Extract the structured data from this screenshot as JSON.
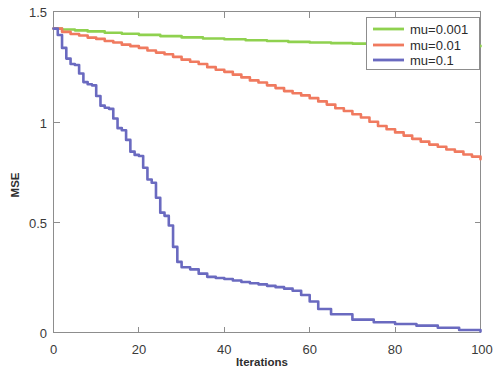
{
  "chart_data": {
    "type": "line",
    "title": "",
    "xlabel": "Iterations",
    "ylabel": "MSE",
    "xlim": [
      0,
      100
    ],
    "ylim": [
      0,
      1.5
    ],
    "xticks": [
      0,
      20,
      40,
      60,
      80,
      100
    ],
    "xtick_labels": [
      "0",
      "20",
      "40",
      "60",
      "80",
      "100"
    ],
    "yticks": [
      0,
      0.5,
      1,
      1.5
    ],
    "ytick_labels": [
      "0",
      "0.5",
      "1",
      "1.5"
    ],
    "grid": false,
    "legend_position": "top-right",
    "series": [
      {
        "name": "mu=0.001",
        "color": "#8FD14F",
        "x": [
          0,
          2,
          5,
          8,
          12,
          16,
          20,
          25,
          30,
          35,
          40,
          45,
          50,
          55,
          60,
          65,
          70,
          75,
          80,
          85,
          90,
          95,
          100
        ],
        "values": [
          1.42,
          1.416,
          1.412,
          1.407,
          1.401,
          1.396,
          1.391,
          1.385,
          1.379,
          1.374,
          1.37,
          1.366,
          1.362,
          1.358,
          1.355,
          1.352,
          1.35,
          1.347,
          1.345,
          1.343,
          1.341,
          1.34,
          1.338
        ]
      },
      {
        "name": "mu=0.01",
        "color": "#F07A5F",
        "x": [
          0,
          2,
          4,
          6,
          8,
          10,
          12,
          14,
          16,
          18,
          20,
          22,
          24,
          26,
          28,
          30,
          32,
          34,
          36,
          38,
          40,
          42,
          44,
          46,
          48,
          50,
          52,
          54,
          56,
          58,
          60,
          62,
          64,
          66,
          68,
          70,
          72,
          74,
          76,
          78,
          80,
          82,
          84,
          86,
          88,
          90,
          92,
          94,
          96,
          98,
          100
        ],
        "values": [
          1.42,
          1.405,
          1.395,
          1.388,
          1.378,
          1.372,
          1.362,
          1.355,
          1.345,
          1.338,
          1.33,
          1.318,
          1.308,
          1.3,
          1.288,
          1.275,
          1.265,
          1.255,
          1.24,
          1.228,
          1.218,
          1.205,
          1.192,
          1.178,
          1.168,
          1.155,
          1.142,
          1.128,
          1.118,
          1.108,
          1.095,
          1.08,
          1.065,
          1.048,
          1.035,
          1.02,
          1.005,
          0.985,
          0.965,
          0.95,
          0.935,
          0.92,
          0.905,
          0.892,
          0.878,
          0.868,
          0.855,
          0.845,
          0.832,
          0.822,
          0.81
        ]
      },
      {
        "name": "mu=0.1",
        "color": "#6A6AC0",
        "x": [
          0,
          1,
          2,
          3,
          4,
          5,
          6,
          7,
          8,
          9,
          10,
          11,
          12,
          13,
          14,
          15,
          16,
          17,
          18,
          19,
          20,
          21,
          22,
          23,
          24,
          25,
          26,
          27,
          28,
          29,
          30,
          32,
          34,
          36,
          38,
          40,
          42,
          44,
          46,
          48,
          50,
          52,
          54,
          56,
          58,
          60,
          62,
          65,
          70,
          75,
          80,
          85,
          90,
          95,
          100
        ],
        "values": [
          1.42,
          1.39,
          1.33,
          1.28,
          1.255,
          1.25,
          1.21,
          1.17,
          1.16,
          1.155,
          1.105,
          1.06,
          1.05,
          1.045,
          1.0,
          0.955,
          0.945,
          0.9,
          0.845,
          0.83,
          0.825,
          0.77,
          0.715,
          0.7,
          0.63,
          0.56,
          0.545,
          0.5,
          0.4,
          0.33,
          0.305,
          0.295,
          0.275,
          0.26,
          0.255,
          0.25,
          0.243,
          0.236,
          0.23,
          0.225,
          0.218,
          0.212,
          0.205,
          0.195,
          0.175,
          0.145,
          0.11,
          0.085,
          0.06,
          0.048,
          0.04,
          0.032,
          0.022,
          0.012,
          0.005
        ]
      }
    ]
  },
  "axes": {
    "y_label": "MSE",
    "x_label": "Iterations",
    "x_tick_labels": [
      "0",
      "20",
      "40",
      "60",
      "80",
      "100"
    ],
    "y_tick_labels": [
      "0",
      "0.5",
      "1",
      "1.5"
    ]
  },
  "legend": {
    "entries": [
      {
        "label": "mu=0.001",
        "color": "#8FD14F"
      },
      {
        "label": "mu=0.01",
        "color": "#F07A5F"
      },
      {
        "label": "mu=0.1",
        "color": "#6A6AC0"
      }
    ]
  }
}
